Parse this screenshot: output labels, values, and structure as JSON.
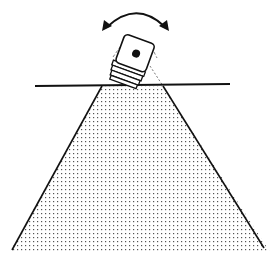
{
  "diagram": {
    "elements": {
      "rotation_arrow": {
        "semantic": "double-headed-curved-arrow-icon",
        "meaning": "camera pans left/right"
      },
      "camera": {
        "semantic": "camera-icon",
        "lens_dot": true,
        "rings": 4
      },
      "horizon_line": {
        "semantic": "horizontal-reference-line"
      },
      "fov_cone": {
        "semantic": "field-of-view-cone",
        "fill": "stippled dots"
      },
      "ghost_outline": {
        "semantic": "dashed-camera-previous-position"
      }
    },
    "colors": {
      "stroke": "#111111",
      "stipple": "#555555",
      "background": "#ffffff"
    }
  },
  "caption": {
    "text": ""
  }
}
